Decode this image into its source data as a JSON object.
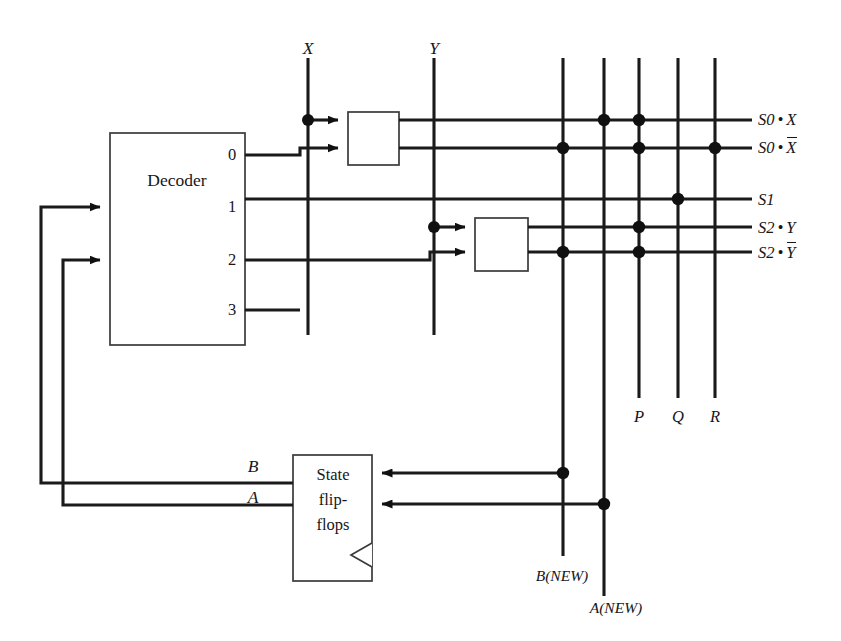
{
  "figure": {
    "type": "logic-circuit-diagram",
    "title": ""
  },
  "blocks": {
    "decoder": {
      "label": "Decoder",
      "outputs": [
        "0",
        "1",
        "2",
        "3"
      ]
    },
    "inverter_x": {
      "label": ""
    },
    "inverter_y": {
      "label": ""
    },
    "state_flipflops": {
      "label_lines": [
        "State",
        "flip-",
        "flops"
      ]
    }
  },
  "inputs": {
    "x": "X",
    "y": "Y"
  },
  "feedback": {
    "b": "B",
    "a": "A"
  },
  "row_outputs": [
    {
      "id": "s0x",
      "pre": "S0",
      "op": "•",
      "post": "X",
      "overbar": false
    },
    {
      "id": "s0xn",
      "pre": "S0",
      "op": "•",
      "post": "X",
      "overbar": true
    },
    {
      "id": "s1",
      "pre": "S1",
      "op": "",
      "post": "",
      "overbar": false
    },
    {
      "id": "s2y",
      "pre": "S2",
      "op": "•",
      "post": "Y",
      "overbar": false
    },
    {
      "id": "s2yn",
      "pre": "S2",
      "op": "•",
      "post": "Y",
      "overbar": true
    }
  ],
  "column_outputs": [
    {
      "id": "bnew",
      "label": "B(NEW)"
    },
    {
      "id": "anew",
      "label": "A(NEW)"
    },
    {
      "id": "p",
      "label": "P"
    },
    {
      "id": "q",
      "label": "Q"
    },
    {
      "id": "r",
      "label": "R"
    }
  ],
  "matrix": {
    "row_labels": [
      "S0•X",
      "S0•X̅",
      "S1",
      "S2•Y",
      "S2•Y̅"
    ],
    "column_labels": [
      "B(NEW)",
      "A(NEW)",
      "P",
      "Q",
      "R"
    ],
    "connections": [
      {
        "row": "S0•X",
        "columns": [
          "A(NEW)",
          "P"
        ]
      },
      {
        "row": "S0•X̅",
        "columns": [
          "B(NEW)",
          "P",
          "R"
        ]
      },
      {
        "row": "S1",
        "columns": [
          "Q"
        ]
      },
      {
        "row": "S2•Y",
        "columns": [
          "P"
        ]
      },
      {
        "row": "S2•Y̅",
        "columns": [
          "B(NEW)",
          "P"
        ]
      }
    ]
  },
  "colors": {
    "ink": "#17161a",
    "wire": "#1a1a1a",
    "box_stroke": "#3a3a3a",
    "background": "#ffffff"
  }
}
